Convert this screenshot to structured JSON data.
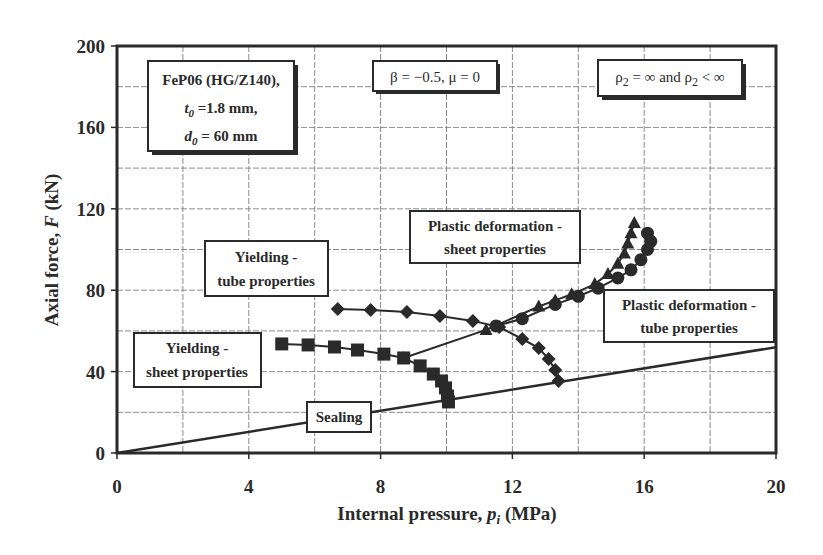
{
  "chart_data": {
    "type": "line",
    "title": "",
    "xlabel": "Internal pressure, p_i (MPa)",
    "ylabel": "Axial force, F (kN)",
    "xlim": [
      0,
      20
    ],
    "ylim": [
      0,
      200
    ],
    "x_ticks": [
      0,
      4,
      8,
      12,
      16,
      20
    ],
    "y_ticks": [
      0,
      40,
      80,
      120,
      160,
      200
    ],
    "grid": true,
    "grid_x_step": 2,
    "grid_y_step": 20,
    "legend_position": "none",
    "series": [
      {
        "name": "Sealing",
        "marker": "none",
        "x": [
          0,
          20
        ],
        "y": [
          0,
          52
        ]
      },
      {
        "name": "Yielding - sheet properties",
        "marker": "square",
        "x": [
          5.0,
          5.8,
          6.6,
          7.3,
          8.1,
          8.7,
          9.2,
          9.6,
          9.85,
          9.97,
          10.03,
          10.06
        ],
        "y": [
          53.6,
          53.1,
          52.1,
          50.6,
          48.6,
          46.7,
          42.8,
          38.8,
          35.4,
          32.0,
          28.0,
          25.1
        ]
      },
      {
        "name": "Yielding - tube properties",
        "marker": "diamond",
        "x": [
          6.7,
          7.7,
          8.8,
          9.8,
          10.8,
          11.6,
          12.3,
          12.8,
          13.1,
          13.3,
          13.4
        ],
        "y": [
          70.8,
          70.3,
          69.3,
          67.3,
          64.9,
          61.9,
          56.0,
          51.6,
          46.2,
          40.8,
          35.4
        ]
      },
      {
        "name": "Plastic deformation - sheet properties",
        "marker": "triangle",
        "x": [
          8.7,
          11.2,
          12.8,
          13.3,
          13.8,
          14.5,
          14.9,
          15.2,
          15.4,
          15.5,
          15.6,
          15.7
        ],
        "y": [
          46.7,
          60.5,
          72.0,
          75.0,
          78.0,
          83.0,
          88.0,
          93.0,
          98.0,
          103.0,
          108.0,
          113.0
        ]
      },
      {
        "name": "Plastic deformation - tube properties",
        "marker": "circle",
        "x": [
          11.5,
          12.3,
          13.3,
          14.0,
          14.6,
          15.2,
          15.6,
          15.9,
          16.1,
          16.2,
          16.1
        ],
        "y": [
          62.4,
          66.0,
          73.0,
          77.0,
          81.0,
          86.0,
          90.0,
          95.0,
          100.0,
          104.0,
          108.0
        ]
      }
    ],
    "annotations": [
      {
        "text": [
          "FeP06 (HG/Z140),",
          "t0 =1.8 mm,",
          "d0 = 60 mm"
        ],
        "x": 1.5,
        "y": 183
      },
      {
        "text": [
          "β = −0.5, μ = 0"
        ],
        "x": 9.0,
        "y": 187
      },
      {
        "text": [
          "ρ2 = ∞ and ρ2 < ∞"
        ],
        "x": 16.6,
        "y": 187
      },
      {
        "text": [
          "Plastic deformation -",
          "sheet properties"
        ],
        "x": 13.3,
        "y": 104
      },
      {
        "text": [
          "Yielding -",
          "tube properties"
        ],
        "x": 4.6,
        "y": 89
      },
      {
        "text": [
          "Plastic deformation -",
          "tube properties"
        ],
        "x": 17.9,
        "y": 67
      },
      {
        "text": [
          "Yielding -",
          "sheet properties"
        ],
        "x": 2.3,
        "y": 44
      },
      {
        "text": [
          "Sealing"
        ],
        "x": 6.3,
        "y": 18
      }
    ]
  },
  "labels": {
    "xlabel_main": "Internal pressure, ",
    "xlabel_var": "p",
    "xlabel_sub": "i",
    "xlabel_unit": " (MPa)",
    "ylabel_main": "Axial force, ",
    "ylabel_var": "F",
    "ylabel_unit": " (kN)",
    "box_material_line1": "FeP06 (HG/Z140),",
    "box_material_t": "t",
    "box_material_t_sub": "0",
    "box_material_t_val": " =1.8 mm,",
    "box_material_d": "d",
    "box_material_d_sub": "0",
    "box_material_d_val": " = 60 mm",
    "box_beta": "β = −0.5, μ = 0",
    "box_rho_a": "ρ",
    "box_rho_sub1": "2",
    "box_rho_mid": " = ∞ and ρ",
    "box_rho_sub2": "2",
    "box_rho_end": " < ∞",
    "plastic_sheet_1": "Plastic deformation -",
    "plastic_sheet_2": "sheet properties",
    "yield_tube_1": "Yielding -",
    "yield_tube_2": "tube properties",
    "plastic_tube_1": "Plastic deformation -",
    "plastic_tube_2": "tube properties",
    "yield_sheet_1": "Yielding -",
    "yield_sheet_2": "sheet properties",
    "sealing": "Sealing"
  },
  "colors": {
    "ink": "#2a2a2a",
    "grid": "#8a8a8a",
    "background": "#ffffff"
  }
}
